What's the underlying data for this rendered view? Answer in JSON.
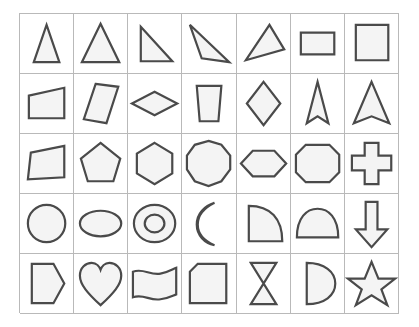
{
  "canvas": {
    "width": 419,
    "height": 327,
    "background_color": "#ffffff"
  },
  "grid": {
    "name": "shape-chart",
    "columns": 7,
    "rows": 5,
    "line_color": "#b9b9b9",
    "shape_stroke_color": "#4a4a4a",
    "shape_fill_color": "#f4f4f4",
    "left": 19,
    "top": 13,
    "width": 380,
    "height": 300
  },
  "cells": [
    {
      "row": 1,
      "col": 1,
      "shape": "narrow-triangle",
      "label": "narrow isosceles triangle"
    },
    {
      "row": 1,
      "col": 2,
      "shape": "equilateral-triangle",
      "label": "equilateral triangle"
    },
    {
      "row": 1,
      "col": 3,
      "shape": "right-triangle",
      "label": "right triangle"
    },
    {
      "row": 1,
      "col": 4,
      "shape": "obtuse-triangle",
      "label": "thin obtuse triangle"
    },
    {
      "row": 1,
      "col": 5,
      "shape": "scalene-triangle",
      "label": "scalene triangle"
    },
    {
      "row": 1,
      "col": 6,
      "shape": "rectangle",
      "label": "rectangle"
    },
    {
      "row": 1,
      "col": 7,
      "shape": "square",
      "label": "square"
    },
    {
      "row": 2,
      "col": 1,
      "shape": "trapezoid-right",
      "label": "trapezoid"
    },
    {
      "row": 2,
      "col": 2,
      "shape": "parallelogram",
      "label": "slanted parallelogram"
    },
    {
      "row": 2,
      "col": 3,
      "shape": "rhombus-wide",
      "label": "wide rhombus"
    },
    {
      "row": 2,
      "col": 4,
      "shape": "trapezoid-cup",
      "label": "tapered trapezoid"
    },
    {
      "row": 2,
      "col": 5,
      "shape": "rhombus-tall",
      "label": "tall rhombus / kite"
    },
    {
      "row": 2,
      "col": 6,
      "shape": "arrowhead-narrow",
      "label": "narrow arrowhead"
    },
    {
      "row": 2,
      "col": 7,
      "shape": "arrowhead-wide",
      "label": "wide arrowhead"
    },
    {
      "row": 3,
      "col": 1,
      "shape": "irregular-quadrilateral",
      "label": "irregular quadrilateral"
    },
    {
      "row": 3,
      "col": 2,
      "shape": "pentagon",
      "label": "pentagon"
    },
    {
      "row": 3,
      "col": 3,
      "shape": "hexagon",
      "label": "hexagon"
    },
    {
      "row": 3,
      "col": 4,
      "shape": "nonagon",
      "label": "nonagon"
    },
    {
      "row": 3,
      "col": 5,
      "shape": "hexagon-flat",
      "label": "flattened hexagon"
    },
    {
      "row": 3,
      "col": 6,
      "shape": "octagon-wide",
      "label": "wide octagon"
    },
    {
      "row": 3,
      "col": 7,
      "shape": "cross",
      "label": "cross / plus"
    },
    {
      "row": 4,
      "col": 1,
      "shape": "circle",
      "label": "circle"
    },
    {
      "row": 4,
      "col": 2,
      "shape": "ellipse",
      "label": "ellipse"
    },
    {
      "row": 4,
      "col": 3,
      "shape": "annulus",
      "label": "ring / annulus"
    },
    {
      "row": 4,
      "col": 4,
      "shape": "crescent",
      "label": "crescent moon"
    },
    {
      "row": 4,
      "col": 5,
      "shape": "quarter-circle",
      "label": "quarter circle"
    },
    {
      "row": 4,
      "col": 6,
      "shape": "semicircle",
      "label": "semicircle"
    },
    {
      "row": 4,
      "col": 7,
      "shape": "down-arrow",
      "label": "downward arrow"
    },
    {
      "row": 5,
      "col": 1,
      "shape": "home-plate",
      "label": "home-plate pentagon"
    },
    {
      "row": 5,
      "col": 2,
      "shape": "heart",
      "label": "heart"
    },
    {
      "row": 5,
      "col": 3,
      "shape": "wavy-banner",
      "label": "wavy banner"
    },
    {
      "row": 5,
      "col": 4,
      "shape": "cut-corner-square",
      "label": "square with cut corner"
    },
    {
      "row": 5,
      "col": 5,
      "shape": "hourglass",
      "label": "hourglass / bowtie"
    },
    {
      "row": 5,
      "col": 6,
      "shape": "half-disc",
      "label": "half disc (D shape)"
    },
    {
      "row": 5,
      "col": 7,
      "shape": "star",
      "label": "five-pointed star"
    }
  ]
}
